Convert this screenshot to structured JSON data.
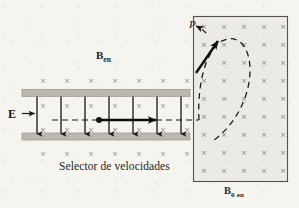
{
  "figure": {
    "kind": "physics-diagram",
    "background_color": "#f6f4ef",
    "ink_color": "#1d1b19"
  },
  "labels": {
    "electric_field": "E",
    "field_in_selector": "B",
    "field_in_selector_sub": "en",
    "field_region": "B",
    "field_region_sub": "0 en",
    "point_p": "P",
    "caption": "Selector de velocidades"
  },
  "velocity_selector": {
    "plate_color": "#b9b5ab",
    "plate_left": 22,
    "plate_right": 190,
    "top_plate_y": 90,
    "bottom_plate_y": 133,
    "plate_thickness": 7,
    "e_arrow_count": 7,
    "e_arrow_color": "#17150f",
    "trajectory_dashed": true,
    "trajectory_y": 120,
    "particle_dot_x": 99,
    "velocity_arrow_from": 99,
    "velocity_arrow_to": 156
  },
  "cross_field": {
    "symbol": "×",
    "color": "#8e8a80",
    "rows_above_plates": 1,
    "rows_below_plates": 1,
    "columns_outside": 7,
    "inside_rows": 2
  },
  "field_box": {
    "x": 193,
    "y": 16,
    "width": 95,
    "height": 166,
    "fill": "#eceae4",
    "border_color": "#4a4640",
    "cross_columns": 5,
    "cross_rows": 9,
    "cross_symbol": "×",
    "cross_color": "#8e8a80"
  },
  "trajectory_arc": {
    "style": "dashed",
    "color": "#16130f",
    "terminates_at": "P"
  },
  "velocity_vector_at_p": {
    "style": "solid",
    "color": "#111111",
    "direction": "up-right"
  }
}
